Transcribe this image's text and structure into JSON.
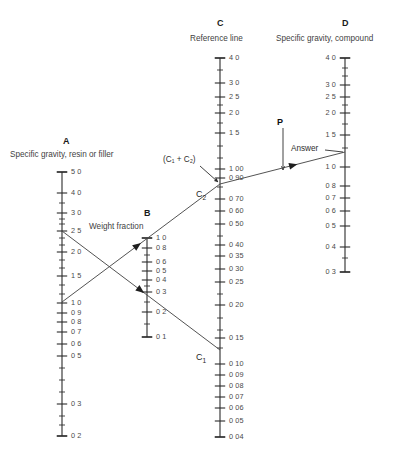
{
  "figure": {
    "width": 400,
    "height": 456,
    "background": "#ffffff",
    "line_color": "#4a4a4a",
    "axis_color": "#2b2b2b",
    "text_color": "#3a3a3a"
  },
  "scales": {
    "A": {
      "title": "A",
      "caption": "Specific gravity, resin or filler",
      "title_x": 63,
      "title_y": 136,
      "caption_x": 10,
      "caption_y": 150,
      "axis_x": 62,
      "axis_top": 172,
      "axis_bottom": 436,
      "label_side": "right",
      "ticks": [
        {
          "label": "5 0",
          "y": 172,
          "major": true
        },
        {
          "label": "4 0",
          "y": 193,
          "major": true
        },
        {
          "label": "",
          "y": 203,
          "major": false
        },
        {
          "label": "3 0",
          "y": 213,
          "major": true
        },
        {
          "label": "",
          "y": 219,
          "major": false
        },
        {
          "label": "",
          "y": 224,
          "major": false
        },
        {
          "label": "2 5",
          "y": 231,
          "major": true
        },
        {
          "label": "",
          "y": 238,
          "major": false
        },
        {
          "label": "",
          "y": 245,
          "major": false
        },
        {
          "label": "2 0",
          "y": 252,
          "major": true
        },
        {
          "label": "",
          "y": 260,
          "major": false
        },
        {
          "label": "",
          "y": 268,
          "major": false
        },
        {
          "label": "1 5",
          "y": 276,
          "major": true
        },
        {
          "label": "",
          "y": 285,
          "major": false
        },
        {
          "label": "",
          "y": 294,
          "major": false
        },
        {
          "label": "1 0",
          "y": 303,
          "major": true
        },
        {
          "label": "0 9",
          "y": 313,
          "major": true
        },
        {
          "label": "0 8",
          "y": 322,
          "major": true
        },
        {
          "label": "0 7",
          "y": 332,
          "major": true
        },
        {
          "label": "0 6",
          "y": 344,
          "major": true
        },
        {
          "label": "0 5",
          "y": 356,
          "major": true
        },
        {
          "label": "",
          "y": 368,
          "major": false
        },
        {
          "label": "",
          "y": 380,
          "major": false
        },
        {
          "label": "",
          "y": 392,
          "major": false
        },
        {
          "label": "0 3",
          "y": 404,
          "major": true
        },
        {
          "label": "",
          "y": 416,
          "major": false
        },
        {
          "label": "",
          "y": 425,
          "major": false
        },
        {
          "label": "0 2",
          "y": 436,
          "major": true
        }
      ]
    },
    "B": {
      "title": "B",
      "caption": "Weight fraction",
      "title_x": 144,
      "title_y": 208,
      "caption_x": 89,
      "caption_y": 222,
      "axis_x": 147,
      "axis_top": 238,
      "axis_bottom": 337,
      "label_side": "right",
      "ticks": [
        {
          "label": "1 0",
          "y": 238,
          "major": true
        },
        {
          "label": "0 8",
          "y": 248,
          "major": true
        },
        {
          "label": "",
          "y": 255,
          "major": false
        },
        {
          "label": "0 6",
          "y": 262,
          "major": true
        },
        {
          "label": "0 5",
          "y": 271,
          "major": true
        },
        {
          "label": "0 4",
          "y": 280,
          "major": true
        },
        {
          "label": "",
          "y": 286,
          "major": false
        },
        {
          "label": "0 3",
          "y": 292,
          "major": true
        },
        {
          "label": "",
          "y": 302,
          "major": false
        },
        {
          "label": "0 2",
          "y": 312,
          "major": true
        },
        {
          "label": "",
          "y": 324,
          "major": false
        },
        {
          "label": "0 1",
          "y": 337,
          "major": true
        }
      ]
    },
    "C": {
      "title": "C",
      "caption": "Reference line",
      "title_x": 217,
      "title_y": 18,
      "caption_x": 190,
      "caption_y": 34,
      "axis_x": 220,
      "axis_top": 58,
      "axis_bottom": 437,
      "label_side": "right",
      "ticks": [
        {
          "label": "4 0",
          "y": 58,
          "major": true
        },
        {
          "label": "",
          "y": 70,
          "major": false
        },
        {
          "label": "3 0",
          "y": 83,
          "major": true
        },
        {
          "label": "2 5",
          "y": 97,
          "major": true
        },
        {
          "label": "",
          "y": 105,
          "major": false
        },
        {
          "label": "2 0",
          "y": 113,
          "major": true
        },
        {
          "label": "",
          "y": 123,
          "major": false
        },
        {
          "label": "1 5",
          "y": 133,
          "major": true
        },
        {
          "label": "",
          "y": 146,
          "major": false
        },
        {
          "label": "",
          "y": 158,
          "major": false
        },
        {
          "label": "1 00",
          "y": 169,
          "major": true
        },
        {
          "label": "0 90",
          "y": 178,
          "major": true
        },
        {
          "label": "",
          "y": 187,
          "major": false
        },
        {
          "label": "0 70",
          "y": 199,
          "major": true
        },
        {
          "label": "0 60",
          "y": 211,
          "major": true
        },
        {
          "label": "0 50",
          "y": 224,
          "major": true
        },
        {
          "label": "",
          "y": 236,
          "major": false
        },
        {
          "label": "0 40",
          "y": 245,
          "major": true
        },
        {
          "label": "0 35",
          "y": 256,
          "major": true
        },
        {
          "label": "0 30",
          "y": 269,
          "major": true
        },
        {
          "label": "0 25",
          "y": 282,
          "major": true
        },
        {
          "label": "",
          "y": 294,
          "major": false
        },
        {
          "label": "0 20",
          "y": 305,
          "major": true
        },
        {
          "label": "",
          "y": 318,
          "major": false
        },
        {
          "label": "",
          "y": 330,
          "major": false
        },
        {
          "label": "0 15",
          "y": 338,
          "major": true
        },
        {
          "label": "",
          "y": 348,
          "major": false
        },
        {
          "label": "0 10",
          "y": 364,
          "major": true
        },
        {
          "label": "0 09",
          "y": 375,
          "major": true
        },
        {
          "label": "0 08",
          "y": 386,
          "major": true
        },
        {
          "label": "0 07",
          "y": 397,
          "major": true
        },
        {
          "label": "0 06",
          "y": 408,
          "major": true
        },
        {
          "label": "0 05",
          "y": 421,
          "major": true
        },
        {
          "label": "0 04",
          "y": 437,
          "major": true
        }
      ]
    },
    "D": {
      "title": "D",
      "caption": "Specific gravity, compound",
      "title_x": 342,
      "title_y": 18,
      "caption_x": 276,
      "caption_y": 34,
      "axis_x": 345,
      "axis_top": 58,
      "axis_bottom": 272,
      "label_side": "left",
      "ticks": [
        {
          "label": "4 0",
          "y": 58,
          "major": true
        },
        {
          "label": "",
          "y": 68,
          "major": false
        },
        {
          "label": "",
          "y": 76,
          "major": false
        },
        {
          "label": "3 0",
          "y": 85,
          "major": true
        },
        {
          "label": "2 5",
          "y": 97,
          "major": true
        },
        {
          "label": "",
          "y": 105,
          "major": false
        },
        {
          "label": "2 0",
          "y": 113,
          "major": true
        },
        {
          "label": "",
          "y": 124,
          "major": false
        },
        {
          "label": "1 5",
          "y": 135,
          "major": true
        },
        {
          "label": "",
          "y": 148,
          "major": false
        },
        {
          "label": "1 0",
          "y": 167,
          "major": true
        },
        {
          "label": "0 8",
          "y": 186,
          "major": true
        },
        {
          "label": "0 7",
          "y": 198,
          "major": true
        },
        {
          "label": "0 6",
          "y": 211,
          "major": true
        },
        {
          "label": "0 5",
          "y": 226,
          "major": true
        },
        {
          "label": "0 4",
          "y": 247,
          "major": true
        },
        {
          "label": "",
          "y": 258,
          "major": false
        },
        {
          "label": "0 3",
          "y": 272,
          "major": true
        }
      ]
    }
  },
  "construction_lines": [
    {
      "name": "line-a-to-c1",
      "x1": 62,
      "y1": 231,
      "x2": 220,
      "y2": 350,
      "arrow_t": 0.52
    },
    {
      "name": "line-a-to-c2",
      "x1": 62,
      "y1": 302,
      "x2": 220,
      "y2": 184,
      "arrow_t": 0.5
    },
    {
      "name": "line-c2-to-d-answer",
      "x1": 220,
      "y1": 184,
      "x2": 345,
      "y2": 152,
      "arrow_t": 0.62
    }
  ],
  "points": [
    {
      "name": "point-c1",
      "label": "C",
      "sub": "1",
      "x": 196,
      "y": 352
    },
    {
      "name": "point-c2",
      "label": "C",
      "sub": "2",
      "x": 196,
      "y": 189
    }
  ],
  "annotations": {
    "sum_label": {
      "text": "(C₁ + C₂)",
      "x": 163,
      "y": 155,
      "leader": {
        "x1": 200,
        "y1": 166,
        "x2": 218,
        "y2": 182
      }
    },
    "p_label": {
      "text": "P",
      "x": 277,
      "y": 117,
      "arrow": {
        "x1": 283,
        "y1": 128,
        "x2": 283,
        "y2": 170
      }
    },
    "answer_label": {
      "text": "Answer",
      "x": 291,
      "y": 144,
      "leader": {
        "x1": 325,
        "y1": 150,
        "x2": 343,
        "y2": 152
      }
    }
  }
}
